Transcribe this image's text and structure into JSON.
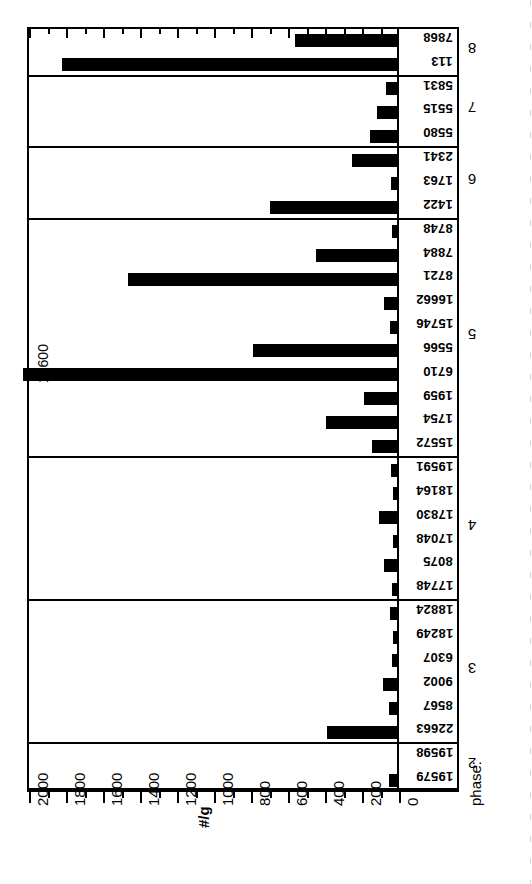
{
  "figure": {
    "axis_title": "#/g",
    "phase_caption": "phase:",
    "offscale_annotation": "12600"
  },
  "axis": {
    "ticks": [
      {
        "value": 2000,
        "label": "2000"
      },
      {
        "value": 1800,
        "label": "1800"
      },
      {
        "value": 1600,
        "label": "1600"
      },
      {
        "value": 1400,
        "label": "1400"
      },
      {
        "value": 1200,
        "label": "1200"
      },
      {
        "value": 1000,
        "label": "1000"
      },
      {
        "value": 800,
        "label": "800"
      },
      {
        "value": 600,
        "label": "600"
      },
      {
        "value": 400,
        "label": "400"
      },
      {
        "value": 200,
        "label": "200"
      },
      {
        "value": 0,
        "label": "0"
      }
    ],
    "minor_step": 100
  },
  "chart_data": {
    "type": "bar",
    "orientation": "horizontal",
    "title": "",
    "xlabel": "#/g",
    "ylabel": "phase:",
    "xlim": [
      0,
      2000
    ],
    "grid": false,
    "legend": "none",
    "annotations": [
      {
        "text": "12600",
        "for_category": "6710",
        "note": "bar exceeds axis maximum"
      }
    ],
    "groups": [
      {
        "phase": "8",
        "categories": [
          "7868",
          "113"
        ],
        "values": [
          551,
          1811
        ]
      },
      {
        "phase": "7",
        "categories": [
          "5831",
          "5515",
          "5580"
        ],
        "values": [
          59,
          108,
          146
        ]
      },
      {
        "phase": "6",
        "categories": [
          "2341",
          "1763",
          "1422"
        ],
        "values": [
          243,
          32,
          686
        ]
      },
      {
        "phase": "5",
        "categories": [
          "8748",
          "7884",
          "8721",
          "16662",
          "15746",
          "5566",
          "6710",
          "1959",
          "1754",
          "15572"
        ],
        "values": [
          27,
          438,
          1454,
          70,
          38,
          778,
          12600,
          178,
          384,
          135
        ]
      },
      {
        "phase": "4",
        "categories": [
          "19591",
          "18164",
          "17830",
          "17048",
          "8075",
          "17748"
        ],
        "values": [
          32,
          22,
          97,
          22,
          70,
          27
        ]
      },
      {
        "phase": "3",
        "categories": [
          "18824",
          "18249",
          "6307",
          "9002",
          "8567",
          "22663"
        ],
        "values": [
          38,
          22,
          27,
          76,
          43,
          378
        ]
      },
      {
        "phase": "2",
        "categories": [
          "19598",
          "19579"
        ],
        "values": [
          0,
          43
        ]
      }
    ]
  }
}
